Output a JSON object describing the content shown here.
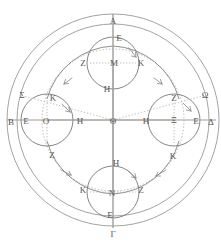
{
  "figure": {
    "canvas": {
      "width": 221,
      "height": 248
    },
    "center": {
      "label": "Θ",
      "x": 113,
      "y": 120
    },
    "colors": {
      "ink": "#6b6a67",
      "ink_light": "#8d8b88",
      "dotted": "#a9a6a2",
      "axis": "#9b9996",
      "text": "#595755",
      "background": "#ffffff"
    },
    "circles": {
      "outer_sphere": {
        "name": "outer-sphere",
        "cx": 113,
        "cy": 120,
        "r": 106
      },
      "inner_sphere": {
        "name": "inner-sphere",
        "cx": 113,
        "cy": 120,
        "r": 96
      },
      "deferent_dotted": {
        "name": "deferent-dotted",
        "cx": 113,
        "cy": 120,
        "r": 71
      },
      "eccentric_solid": {
        "name": "eccentric-solid",
        "cx": 113,
        "cy": 120,
        "r": 67
      }
    },
    "epicycles": [
      {
        "name": "epicycle-top",
        "cx": 113,
        "cy": 63,
        "r": 26,
        "center_label": "Μ"
      },
      {
        "name": "epicycle-left",
        "cx": 47,
        "cy": 120,
        "r": 26,
        "center_label": "Ο"
      },
      {
        "name": "epicycle-right",
        "cx": 174,
        "cy": 120,
        "r": 26,
        "center_label": "Ξ"
      },
      {
        "name": "epicycle-bottom",
        "cx": 113,
        "cy": 192,
        "r": 26,
        "center_label": "Ν"
      }
    ],
    "axes": {
      "vertical": {
        "name": "vertical-axis",
        "x1": 113,
        "y1": 14,
        "x2": 113,
        "y2": 228
      },
      "horizontal": {
        "name": "horizontal-axis",
        "x1": 7,
        "y1": 120,
        "x2": 216,
        "y2": 120
      },
      "oblique_left": {
        "name": "oblique-axis-left",
        "x1": 113,
        "y1": 120,
        "x2": 22,
        "y2": 95
      },
      "oblique_right": {
        "name": "oblique-axis-right",
        "x1": 113,
        "y1": 120,
        "x2": 204,
        "y2": 95
      }
    },
    "labels": [
      {
        "id": "A",
        "text": "Α",
        "x": 113,
        "y": 21,
        "role": "cardinal-top"
      },
      {
        "id": "G",
        "text": "Γ",
        "x": 113,
        "y": 234,
        "role": "cardinal-bottom"
      },
      {
        "id": "B",
        "text": "Β",
        "x": 11,
        "y": 122,
        "role": "cardinal-left"
      },
      {
        "id": "D",
        "text": "Δ",
        "x": 211,
        "y": 122,
        "role": "cardinal-right"
      },
      {
        "id": "S",
        "text": "Σ",
        "x": 22,
        "y": 95,
        "role": "oblique-left"
      },
      {
        "id": "W",
        "text": "Ω",
        "x": 205,
        "y": 95,
        "role": "oblique-right"
      },
      {
        "id": "E1",
        "text": "Ε",
        "x": 119,
        "y": 38,
        "role": "epicycle-top-apex"
      },
      {
        "id": "Z1",
        "text": "Ζ",
        "x": 83,
        "y": 63,
        "role": "epicycle-top-left"
      },
      {
        "id": "M",
        "text": "Μ",
        "x": 114,
        "y": 63,
        "role": "epicycle-top-center"
      },
      {
        "id": "K1",
        "text": "Κ",
        "x": 141,
        "y": 63,
        "role": "epicycle-top-right"
      },
      {
        "id": "H1",
        "text": "Η",
        "x": 107,
        "y": 89,
        "role": "epicycle-top-base"
      },
      {
        "id": "K2",
        "text": "Κ",
        "x": 53,
        "y": 98,
        "role": "epicycle-left-top"
      },
      {
        "id": "E2",
        "text": "Ε",
        "x": 26,
        "y": 121,
        "role": "epicycle-left-outer"
      },
      {
        "id": "O",
        "text": "Ο",
        "x": 46,
        "y": 121,
        "role": "epicycle-left-center"
      },
      {
        "id": "H2",
        "text": "Η",
        "x": 80,
        "y": 121,
        "role": "epicycle-left-inner"
      },
      {
        "id": "Z2",
        "text": "Ζ",
        "x": 52,
        "y": 155,
        "role": "epicycle-left-bottom"
      },
      {
        "id": "TH",
        "text": "Θ",
        "x": 113,
        "y": 121,
        "role": "center"
      },
      {
        "id": "Z3",
        "text": "Ζ",
        "x": 174,
        "y": 98,
        "role": "epicycle-right-top"
      },
      {
        "id": "H3",
        "text": "Η",
        "x": 146,
        "y": 121,
        "role": "epicycle-right-inner"
      },
      {
        "id": "XI",
        "text": "Ξ",
        "x": 174,
        "y": 120,
        "role": "epicycle-right-center"
      },
      {
        "id": "E3",
        "text": "Ε",
        "x": 196,
        "y": 121,
        "role": "epicycle-right-outer"
      },
      {
        "id": "K3",
        "text": "Κ",
        "x": 173,
        "y": 156,
        "role": "epicycle-right-bottom"
      },
      {
        "id": "H4",
        "text": "Η",
        "x": 116,
        "y": 163,
        "role": "epicycle-bottom-apex"
      },
      {
        "id": "K4",
        "text": "Κ",
        "x": 83,
        "y": 190,
        "role": "epicycle-bottom-left"
      },
      {
        "id": "N",
        "text": "Ν",
        "x": 112,
        "y": 193,
        "role": "epicycle-bottom-center"
      },
      {
        "id": "Z4",
        "text": "Ζ",
        "x": 141,
        "y": 190,
        "role": "epicycle-bottom-right"
      },
      {
        "id": "E4",
        "text": "Ε",
        "x": 110,
        "y": 215,
        "role": "epicycle-bottom-base"
      }
    ],
    "arrows": [
      {
        "id": "arrow-top-left",
        "x": 70,
        "y": 80,
        "dir": "ccw"
      },
      {
        "id": "arrow-top-right",
        "x": 155,
        "y": 80,
        "dir": "cw"
      },
      {
        "id": "arrow-bottom-left",
        "x": 67,
        "y": 173,
        "dir": "ccw"
      },
      {
        "id": "arrow-bottom-right",
        "x": 158,
        "y": 176,
        "dir": "cw"
      },
      {
        "id": "arrow-epi-top",
        "x": 133,
        "y": 53,
        "dir": "cw"
      },
      {
        "id": "arrow-epi-left",
        "x": 68,
        "y": 111,
        "dir": "cw"
      },
      {
        "id": "arrow-epi-right",
        "x": 189,
        "y": 110,
        "dir": "cw"
      },
      {
        "id": "arrow-epi-bottom",
        "x": 133,
        "y": 175,
        "dir": "cw"
      }
    ]
  }
}
